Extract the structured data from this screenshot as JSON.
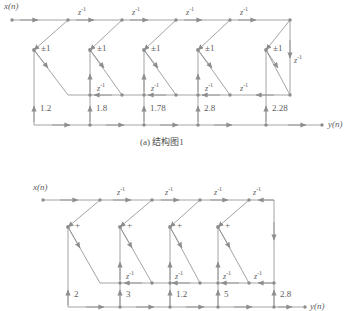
{
  "figure": {
    "signal_color": "#8d8d8d",
    "text_color": "#5d5d5d",
    "background": "#ffffff"
  },
  "diagram_a": {
    "caption": "(a) 结构图1",
    "input_label": "x(n)",
    "output_label": "y(n)",
    "stage_symbol": "±1",
    "delay_label": "z",
    "delay_exponent": "-1",
    "stages": 5,
    "coefficients": [
      "1.2",
      "1.8",
      "1.78",
      "2.8",
      "2.28"
    ],
    "top_delays": [
      "z-1",
      "z-1",
      "z-1",
      "z-1"
    ],
    "mid_delays": [
      "z-1",
      "z-1",
      "z-1",
      "z-1"
    ],
    "right_delay": "z-1"
  },
  "diagram_b": {
    "caption": "(b) 结构图2",
    "input_label": "x(n)",
    "output_label": "y(n)",
    "stage_symbol": "+",
    "delay_label": "z",
    "delay_exponent": "-1",
    "stages": 5,
    "coefficients": [
      "2",
      "3",
      "1.2",
      "5",
      "2.8"
    ],
    "top_delays": [
      "z-1",
      "z-1",
      "z-1",
      "z-1"
    ],
    "mid_delays": [
      "z-1",
      "z-1",
      "z-1"
    ],
    "right_delay": "z-1"
  },
  "bottom_cut_text": "图"
}
